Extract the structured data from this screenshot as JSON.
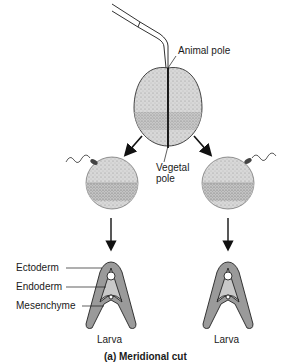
{
  "figure": {
    "caption": "(a) Meridional cut",
    "labels": {
      "animal_pole": "Animal pole",
      "vegetal_pole_line1": "Vegetal",
      "vegetal_pole_line2": "pole",
      "ectoderm": "Ectoderm",
      "endoderm": "Endoderm",
      "mesenchyme": "Mesenchyme",
      "larva_left": "Larva",
      "larva_right": "Larva"
    },
    "elements": {
      "micropipette": "glass-needle",
      "egg": "dividing-egg-meridional-cut",
      "left_half": "half-embryo-with-sperm",
      "right_half": "half-embryo-with-sperm",
      "left_larva": "pluteus-larva",
      "right_larva": "pluteus-larva"
    },
    "colors": {
      "stroke": "#1a1a1a",
      "fill_light": "#d4d4d4",
      "fill_band": "#bcbcbc",
      "larva_fill": "#a8a8a8"
    }
  }
}
